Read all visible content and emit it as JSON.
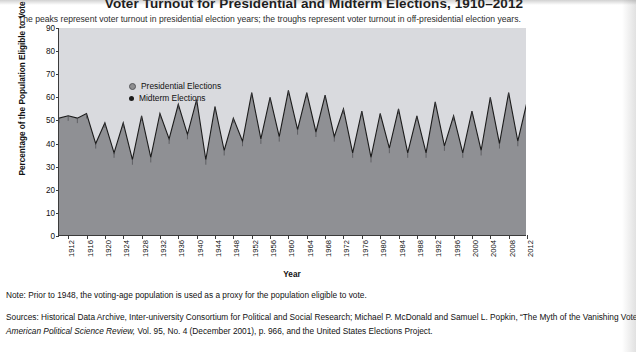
{
  "title": "Voter Turnout for Presidential and Midterm Elections, 1910–2012",
  "subtitle": "The peaks represent voter turnout in presidential election years; the troughs represent voter turnout in off-presidential election years.",
  "legend": {
    "presidential": "Presidential Elections",
    "midterm": "Midterm Elections"
  },
  "note": "Note: Prior to 1948, the voting-age population is used as a proxy for the population eligible to vote.",
  "sources_line1": "Sources: Historical Data Archive, Inter-university Consortium for Political and Social Research; Michael P. McDonald and Samuel L. Popkin, “The Myth of the Vanishing Voter,”",
  "sources_line2_italic": "American Political Science Review,",
  "sources_line2_rest": " Vol. 95, No. 4 (December 2001), p. 966, and the United States Elections Project.",
  "colors": {
    "plot_background": "#d9dade",
    "area_fill": "#8f9094",
    "line": "#1b1b1b",
    "axis": "#3b3b3b",
    "presidential_marker": "#8e8e90",
    "midterm_marker": "#1b1b1b"
  },
  "chart_data": {
    "type": "area",
    "title": "Voter Turnout for Presidential and Midterm Elections, 1910–2012",
    "xlabel": "Year",
    "ylabel": "Percentage of the Population Eligible to Vote",
    "ylim": [
      0,
      90
    ],
    "yticks": [
      0,
      10,
      20,
      30,
      40,
      50,
      60,
      70,
      80,
      90
    ],
    "xlim": [
      1910,
      2012
    ],
    "xticks": [
      1912,
      1916,
      1920,
      1924,
      1928,
      1932,
      1936,
      1940,
      1944,
      1948,
      1952,
      1956,
      1960,
      1964,
      1968,
      1972,
      1976,
      1980,
      1984,
      1988,
      1992,
      1996,
      2000,
      2004,
      2008,
      2012
    ],
    "grid": false,
    "legend_position": "top-left inside plot",
    "x": [
      1910,
      1912,
      1914,
      1916,
      1918,
      1920,
      1922,
      1924,
      1926,
      1928,
      1930,
      1932,
      1934,
      1936,
      1938,
      1940,
      1942,
      1944,
      1946,
      1948,
      1950,
      1952,
      1954,
      1956,
      1958,
      1960,
      1962,
      1964,
      1966,
      1968,
      1970,
      1972,
      1974,
      1976,
      1978,
      1980,
      1982,
      1984,
      1986,
      1988,
      1990,
      1992,
      1994,
      1996,
      1998,
      2000,
      2002,
      2004,
      2006,
      2008,
      2010,
      2012
    ],
    "values": [
      51,
      52,
      51,
      53,
      40,
      49,
      36,
      49,
      33,
      52,
      34,
      53,
      42,
      57,
      44,
      59,
      33,
      56,
      37,
      51,
      41,
      62,
      42,
      60,
      43,
      63,
      46,
      62,
      45,
      61,
      43,
      55,
      36,
      54,
      34,
      53,
      38,
      55,
      36,
      52,
      36,
      58,
      39,
      52,
      36,
      54,
      37,
      60,
      40,
      62,
      41,
      58
    ],
    "series": [
      {
        "name": "Presidential Elections",
        "x": [
          1912,
          1916,
          1920,
          1924,
          1928,
          1932,
          1936,
          1940,
          1944,
          1948,
          1952,
          1956,
          1960,
          1964,
          1968,
          1972,
          1976,
          1980,
          1984,
          1988,
          1992,
          1996,
          2000,
          2004,
          2008,
          2012
        ],
        "values": [
          52,
          53,
          49,
          49,
          52,
          53,
          57,
          59,
          56,
          51,
          62,
          60,
          63,
          62,
          61,
          55,
          54,
          53,
          55,
          52,
          58,
          52,
          54,
          60,
          62,
          58
        ]
      },
      {
        "name": "Midterm Elections",
        "x": [
          1910,
          1914,
          1918,
          1922,
          1926,
          1930,
          1934,
          1938,
          1942,
          1946,
          1950,
          1954,
          1958,
          1962,
          1966,
          1970,
          1974,
          1978,
          1982,
          1986,
          1990,
          1994,
          1998,
          2002,
          2006,
          2010
        ],
        "values": [
          51,
          51,
          40,
          36,
          33,
          34,
          42,
          44,
          33,
          37,
          41,
          42,
          43,
          46,
          45,
          43,
          36,
          34,
          38,
          36,
          36,
          39,
          36,
          37,
          40,
          41
        ]
      }
    ]
  }
}
